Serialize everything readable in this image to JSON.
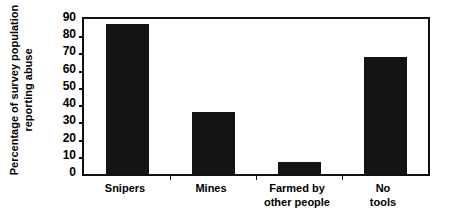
{
  "chart_data": {
    "type": "bar",
    "title": "",
    "xlabel": "",
    "ylabel_line1": "Percentage of survey population",
    "ylabel_line2": "reporting abuse",
    "categories": [
      "Snipers",
      "Mines",
      "Farmed by other people",
      "No tools"
    ],
    "category_lines": [
      [
        "Snipers"
      ],
      [
        "Mines"
      ],
      [
        "Farmed by",
        "other people"
      ],
      [
        "No",
        "tools"
      ]
    ],
    "values": [
      87,
      36,
      7,
      68
    ],
    "ylim": [
      0,
      90
    ],
    "ytick_labels": [
      "0",
      "10",
      "20",
      "30",
      "40",
      "50",
      "60",
      "70",
      "80",
      "90"
    ],
    "ytick_values": [
      0,
      10,
      20,
      30,
      40,
      50,
      60,
      70,
      80,
      90
    ],
    "grid": false,
    "legend": "none",
    "bar_color": "#141414",
    "axis_color": "#111111",
    "background_color": "#ffffff"
  }
}
